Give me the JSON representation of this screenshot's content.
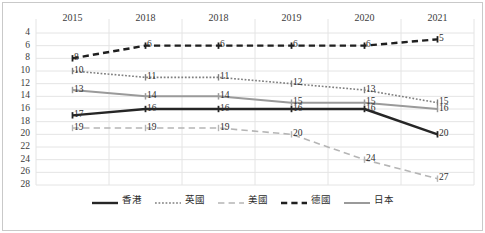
{
  "chart_data": {
    "type": "line",
    "title": "",
    "subtitle": "",
    "xlabel": "",
    "ylabel": "",
    "categories": [
      "2015",
      "2018",
      "2018",
      "2019",
      "2020",
      "2021"
    ],
    "ylim": [
      4,
      28
    ],
    "y_inverted": true,
    "y_ticks": [
      4,
      6,
      8,
      10,
      12,
      14,
      16,
      18,
      20,
      22,
      24,
      26,
      28
    ],
    "grid": "horizontal",
    "legend_position": "bottom",
    "series": [
      {
        "name": "香港",
        "values": [
          17,
          16,
          16,
          16,
          16,
          20
        ],
        "color": "#262626",
        "style": "solid",
        "width": 2.4
      },
      {
        "name": "英國",
        "values": [
          10,
          11,
          11,
          12,
          13,
          15
        ],
        "color": "#7f7f7f",
        "style": "dotted",
        "width": 1.6
      },
      {
        "name": "美國",
        "values": [
          19,
          19,
          19,
          20,
          24,
          27
        ],
        "color": "#b5b5b5",
        "style": "dashed-long",
        "width": 1.6
      },
      {
        "name": "德國",
        "values": [
          8,
          6,
          6,
          6,
          6,
          5
        ],
        "color": "#1f1f1f",
        "style": "dashed-heavy",
        "width": 2.4
      },
      {
        "name": "日本",
        "values": [
          13,
          14,
          14,
          15,
          15,
          16
        ],
        "color": "#9a9a9a",
        "style": "solid",
        "width": 2.0
      }
    ],
    "data_labels": [
      {
        "series": "香港",
        "index": 0,
        "text": "17"
      },
      {
        "series": "香港",
        "index": 1,
        "text": "16"
      },
      {
        "series": "香港",
        "index": 2,
        "text": "16"
      },
      {
        "series": "香港",
        "index": 3,
        "text": "16"
      },
      {
        "series": "香港",
        "index": 4,
        "text": "16"
      },
      {
        "series": "香港",
        "index": 5,
        "text": "20"
      },
      {
        "series": "英國",
        "index": 0,
        "text": "10"
      },
      {
        "series": "英國",
        "index": 1,
        "text": "11"
      },
      {
        "series": "英國",
        "index": 2,
        "text": "11"
      },
      {
        "series": "英國",
        "index": 3,
        "text": "12"
      },
      {
        "series": "英國",
        "index": 4,
        "text": "13"
      },
      {
        "series": "英國",
        "index": 5,
        "text": "15"
      },
      {
        "series": "美國",
        "index": 0,
        "text": "19"
      },
      {
        "series": "美國",
        "index": 1,
        "text": "19"
      },
      {
        "series": "美國",
        "index": 2,
        "text": "19"
      },
      {
        "series": "美國",
        "index": 3,
        "text": "20"
      },
      {
        "series": "美國",
        "index": 4,
        "text": "24"
      },
      {
        "series": "美國",
        "index": 5,
        "text": "27"
      },
      {
        "series": "德國",
        "index": 0,
        "text": "8"
      },
      {
        "series": "德國",
        "index": 1,
        "text": "6"
      },
      {
        "series": "德國",
        "index": 2,
        "text": "6"
      },
      {
        "series": "德國",
        "index": 3,
        "text": "6"
      },
      {
        "series": "德國",
        "index": 4,
        "text": "6"
      },
      {
        "series": "德國",
        "index": 5,
        "text": "5"
      },
      {
        "series": "日本",
        "index": 0,
        "text": "13"
      },
      {
        "series": "日本",
        "index": 1,
        "text": "14"
      },
      {
        "series": "日本",
        "index": 2,
        "text": "14"
      },
      {
        "series": "日本",
        "index": 3,
        "text": "15"
      },
      {
        "series": "日本",
        "index": 4,
        "text": "15"
      },
      {
        "series": "日本",
        "index": 5,
        "text": "16"
      }
    ]
  },
  "colors": {
    "grid": "#e4e4e4",
    "axis_text": "#3b3b3b",
    "border": "#c9c9c9",
    "background": "#ffffff"
  }
}
